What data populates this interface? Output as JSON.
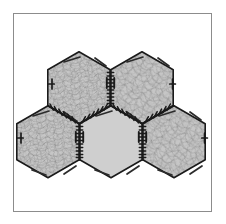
{
  "figure": {
    "background_color": "#ffffff",
    "frame": {
      "name": "figure-border",
      "stroke_color": "#8c8c8c",
      "stroke_width": 1,
      "x": 13,
      "y": 13,
      "width": 199,
      "height": 199
    },
    "palette": {
      "tile_fill_textured": "#c6c6c6",
      "tile_fill_plain": "#cfcfcf",
      "texture_stroke": "#8a8a8a",
      "outline_stroke": "#1a1a1a",
      "edge_tick_stroke": "#1a1a1a",
      "chord_mark_stroke": "#2b2b2b"
    },
    "geometry": {
      "orientation": "pointy-top",
      "circumradius": 36,
      "rows": 2,
      "tile_count": 5
    },
    "tiles": [
      {
        "id": "tile-top-left",
        "label": "Top Left Hexagon",
        "row": 0,
        "column": 0,
        "center_x": 79,
        "center_y": 83,
        "fill": "#c6c6c6",
        "textured": true,
        "edge_ticks": true
      },
      {
        "id": "tile-top-right",
        "label": "Top Right Hexagon",
        "row": 0,
        "column": 1,
        "center_x": 142,
        "center_y": 83,
        "fill": "#c6c6c6",
        "textured": true,
        "edge_ticks": true
      },
      {
        "id": "tile-bottom-left",
        "label": "Bottom Left Hexagon",
        "row": 1,
        "column": 0,
        "center_x": 48,
        "center_y": 137,
        "fill": "#c6c6c6",
        "textured": true,
        "edge_ticks": true
      },
      {
        "id": "tile-bottom-center",
        "label": "Bottom Center Hexagon",
        "row": 1,
        "column": 1,
        "center_x": 111,
        "center_y": 137,
        "fill": "#cfcfcf",
        "textured": false,
        "edge_ticks": true
      },
      {
        "id": "tile-bottom-right",
        "label": "Bottom Right Hexagon",
        "row": 1,
        "column": 2,
        "center_x": 174,
        "center_y": 137,
        "fill": "#c6c6c6",
        "textured": true,
        "edge_ticks": true
      }
    ]
  }
}
